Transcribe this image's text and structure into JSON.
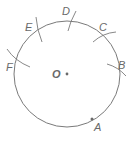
{
  "diagram": {
    "colors": {
      "stroke": "#7a7a7a",
      "text": "#6a6a6a",
      "background": "#ffffff"
    },
    "circle": {
      "cx": 67,
      "cy": 74,
      "r": 53
    },
    "center": {
      "label": "O",
      "x": 67,
      "y": 74,
      "label_x": 52,
      "label_y": 78
    },
    "points": [
      {
        "label": "A",
        "x": 92,
        "y": 119,
        "label_x": 94,
        "label_y": 131,
        "marker": "dot"
      },
      {
        "label": "B",
        "x": 118,
        "y": 68,
        "label_x": 118,
        "label_y": 68,
        "marker": "arc"
      },
      {
        "label": "C",
        "x": 100,
        "y": 33,
        "label_x": 99,
        "label_y": 31,
        "marker": "arc"
      },
      {
        "label": "D",
        "x": 70,
        "y": 21,
        "label_x": 62,
        "label_y": 15,
        "marker": "arc"
      },
      {
        "label": "E",
        "x": 36,
        "y": 29,
        "label_x": 25,
        "label_y": 30,
        "marker": "arc"
      },
      {
        "label": "F",
        "x": 17,
        "y": 63,
        "label_x": 6,
        "label_y": 70,
        "marker": "arc"
      }
    ]
  }
}
